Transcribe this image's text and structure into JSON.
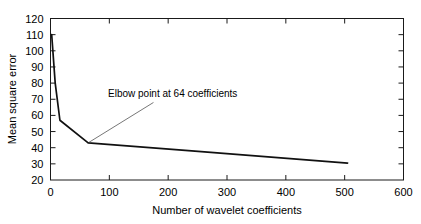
{
  "chart_data": {
    "type": "line",
    "title": "",
    "xlabel": "Number of wavelet coefficients",
    "ylabel": "Mean square error",
    "xlim": [
      0,
      600
    ],
    "ylim": [
      20,
      120
    ],
    "xticks": [
      0,
      100,
      200,
      300,
      400,
      500,
      600
    ],
    "xtick_labels": [
      "0",
      "100",
      "200",
      "300",
      "400",
      "500",
      "600"
    ],
    "yticks": [
      20,
      30,
      40,
      50,
      60,
      70,
      80,
      90,
      100,
      110,
      120
    ],
    "ytick_labels": [
      "20",
      "30",
      "40",
      "50",
      "60",
      "70",
      "80",
      "90",
      "100",
      "110",
      "120"
    ],
    "grid": false,
    "legend": false,
    "series": [
      {
        "name": "Mean square error vs wavelet coefficients",
        "color": "#111111",
        "x": [
          2,
          8,
          16,
          64,
          240,
          505
        ],
        "values": [
          110,
          80,
          57,
          43,
          38,
          30.5
        ]
      }
    ],
    "annotations": [
      {
        "text": "Elbow point at 64 coefficients",
        "text_x": 175,
        "text_y": 68,
        "point_x": 64,
        "point_y": 43,
        "leader_color": "#777777"
      }
    ]
  },
  "axes": {
    "x_title": "Number of wavelet coefficients",
    "y_title": "Mean square error"
  },
  "annotation": {
    "label": "Elbow point at 64 coefficients"
  }
}
